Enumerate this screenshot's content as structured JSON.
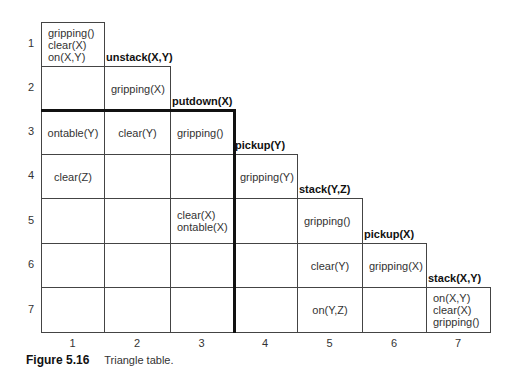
{
  "caption": {
    "figure": "Figure 5.16",
    "text": "Triangle table."
  },
  "row_labels": [
    "1",
    "2",
    "3",
    "4",
    "5",
    "6",
    "7"
  ],
  "col_labels": [
    "1",
    "2",
    "3",
    "4",
    "5",
    "6",
    "7"
  ],
  "operators": [
    {
      "col": 2,
      "name": "unstack(X,Y)"
    },
    {
      "col": 3,
      "name": "putdown(X)"
    },
    {
      "col": 4,
      "name": "pickup(Y)"
    },
    {
      "col": 5,
      "name": "stack(Y,Z)"
    },
    {
      "col": 6,
      "name": "pickup(X)"
    },
    {
      "col": 7,
      "name": "stack(X,Y)"
    }
  ],
  "cells": {
    "r1c1": [
      "gripping()",
      "clear(X)",
      "on(X,Y)"
    ],
    "r2c2": [
      "gripping(X)"
    ],
    "r3c1": [
      "ontable(Y)"
    ],
    "r3c2": [
      "clear(Y)"
    ],
    "r3c3": [
      "gripping()"
    ],
    "r4c1": [
      "clear(Z)"
    ],
    "r4c4": [
      "gripping(Y)"
    ],
    "r5c3": [
      "clear(X)",
      "ontable(X)"
    ],
    "r5c5": [
      "gripping()"
    ],
    "r6c5": [
      "clear(Y)"
    ],
    "r6c6": [
      "gripping(X)"
    ],
    "r7c5": [
      "on(Y,Z)"
    ],
    "r7c7": [
      "on(X,Y)",
      "clear(X)",
      "gripping()"
    ]
  },
  "colors": {
    "line": "#444444",
    "thick_line": "#111111",
    "text": "#333333"
  }
}
